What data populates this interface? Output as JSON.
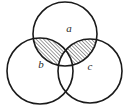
{
  "figure": {
    "background_color": "#ffffff",
    "stroke_color": "#1a1a1a",
    "hatch_color": "#1a1a1a",
    "label_color": "#2a2a2a",
    "width": 130,
    "height": 110
  },
  "circles": [
    {
      "id": "a",
      "label": "a",
      "cx": 65,
      "cy": 34,
      "r": 32,
      "label_x": 69,
      "label_y": 29
    },
    {
      "id": "b",
      "label": "b",
      "cx": 40,
      "cy": 71,
      "r": 33,
      "label_x": 41,
      "label_y": 65
    },
    {
      "id": "c",
      "label": "c",
      "cx": 90,
      "cy": 71,
      "r": 32,
      "label_x": 90,
      "label_y": 67
    }
  ],
  "shaded_regions": [
    {
      "id": "a-and-b-not-c",
      "description": "a intersect b minus c",
      "fill": "hatch-diagonal"
    },
    {
      "id": "a-and-c-not-b",
      "description": "a intersect c minus b",
      "fill": "hatch-diagonal"
    }
  ],
  "hatch": {
    "pattern": "diagonal-lines-up-right",
    "angle_deg": 45,
    "spacing": 2.6,
    "line_width": 0.8
  }
}
